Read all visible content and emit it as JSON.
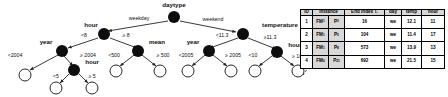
{
  "figure": {
    "type": "decision-tree-with-instance-table"
  },
  "tree": {
    "root": {
      "label": "daytype"
    },
    "internal_nodes": [
      {
        "id": "daytype",
        "label": "daytype"
      },
      {
        "id": "hour-left",
        "label": "hour"
      },
      {
        "id": "year-left",
        "label": "year"
      },
      {
        "id": "hour-left-deep",
        "label": "hour"
      },
      {
        "id": "mean",
        "label": "mean"
      },
      {
        "id": "temperature",
        "label": "temperature"
      },
      {
        "id": "year-right",
        "label": "year"
      },
      {
        "id": "hour-right",
        "label": "hour"
      }
    ],
    "edge_labels": {
      "root_left": "weekday",
      "root_right": "weekend",
      "hour_left_lt": "<8",
      "hour_left_ge": "≥ 8",
      "year_left_lt": "<2004",
      "year_left_ge": "≥ 2004",
      "hour_deep_lt": "<5",
      "hour_deep_ge": "≥ 5",
      "mean_lt": "<500",
      "mean_ge": "≥ 500",
      "temp_lt": "<11.3",
      "temp_ge": "≥11.3",
      "year_right_lt": "<2005",
      "year_right_ge": "≥ 2005",
      "hour_right_lt": "<10",
      "hour_right_ge": "≥ 10"
    }
  },
  "table": {
    "headers": [
      "ID",
      "Instance",
      "End Index T.",
      "day",
      "temp",
      "hour"
    ],
    "rows": [
      {
        "id": "1",
        "fm": "FM",
        "fm_sub": "1",
        "p": "P",
        "p_sub": "3",
        "end_index": "16",
        "day": "we",
        "temp": "12.1",
        "hour": "11"
      },
      {
        "id": "2",
        "fm": "FM",
        "fm_sub": "1",
        "p": "P",
        "p_sub": "5",
        "end_index": "104",
        "day": "we",
        "temp": "11.4",
        "hour": "17"
      },
      {
        "id": "3",
        "fm": "FM",
        "fm_sub": "1",
        "p": "P",
        "p_sub": "8",
        "end_index": "573",
        "day": "we",
        "temp": "13.9",
        "hour": "13"
      },
      {
        "id": "4",
        "fm": "FM",
        "fm_sub": "6",
        "p": "P",
        "p_sub": "21",
        "end_index": "692",
        "day": "we",
        "temp": "21.5",
        "hour": "15"
      }
    ]
  },
  "colors": {
    "node_fill": "#0d0d0d",
    "leaf_stroke": "#111111",
    "edge": "#222222",
    "header_bg": "#d8d8d8",
    "text": "#000000"
  }
}
